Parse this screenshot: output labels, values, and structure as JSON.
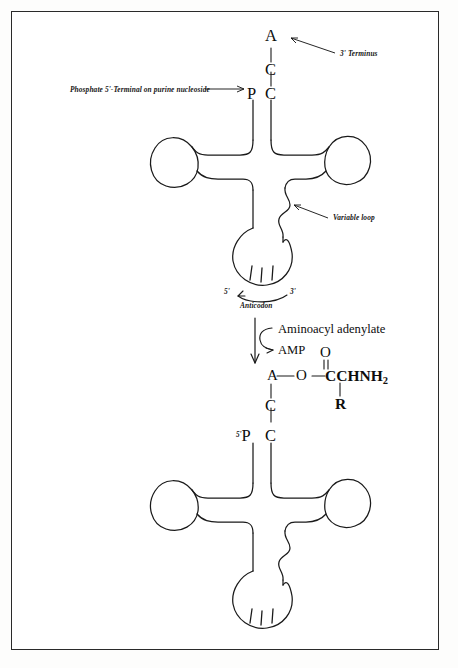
{
  "figure": {
    "background_color": "#ffffff",
    "ink_color": "#111111",
    "border_color": "#2a2a2a"
  },
  "top_structure": {
    "name": "uncharged tRNA cloverleaf",
    "acceptor_bases": [
      "A",
      "C",
      "C"
    ],
    "phosphate_letter": "P",
    "labels": {
      "three_prime_terminus": "3' Terminus",
      "phosphate_terminal": "Phosphate 5'-Terminal on purine nucleoside",
      "variable_loop": "Variable loop",
      "anticodon": "Anticodon",
      "five_prime": "5'",
      "three_prime": "3'"
    },
    "anticodon_tick_count": 3
  },
  "reaction": {
    "substrate_in": "Aminoacyl adenylate",
    "product_out": "AMP",
    "direction": "downward"
  },
  "bottom_structure": {
    "name": "aminoacyl-tRNA (charged) cloverleaf",
    "acceptor_bases": [
      "A",
      "C",
      "C"
    ],
    "phosphate_letter": "P",
    "five_prime_label": "5'",
    "aminoacyl_group": {
      "ester_oxygen": "O",
      "carbonyl_oxygen": "O",
      "chain": "CCHNH",
      "chain_subscript": "2",
      "side_chain": "R",
      "bond_dash": "—"
    },
    "anticodon_tick_count": 3
  }
}
